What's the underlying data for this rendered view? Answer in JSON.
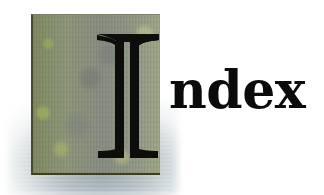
{
  "heading": {
    "full_text": "Index",
    "drop_cap_letter": "I",
    "rest_of_word": "ndex"
  },
  "colors": {
    "text": "#0b0b0b",
    "stone_base": "#8c9379",
    "stone_edge": "#3f3d22",
    "shadow": "#7f949a",
    "background": "#ffffff"
  },
  "icons": {
    "drop_cap_tile": "stone-texture-tile"
  }
}
